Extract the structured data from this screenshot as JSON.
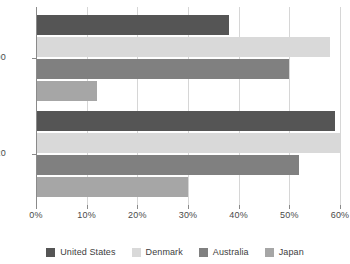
{
  "chart_data": {
    "type": "bar",
    "orientation": "horizontal",
    "title": "",
    "subtitle": "",
    "xlabel": "",
    "ylabel": "",
    "categories": [
      "1990",
      "2020"
    ],
    "series": [
      {
        "name": "United States",
        "color": "#555555",
        "values": [
          38,
          59
        ]
      },
      {
        "name": "Denmark",
        "color": "#d9d9d9",
        "values": [
          58,
          60
        ]
      },
      {
        "name": "Australia",
        "color": "#808080",
        "values": [
          50,
          52
        ]
      },
      {
        "name": "Japan",
        "color": "#a6a6a6",
        "values": [
          12,
          30
        ]
      }
    ],
    "xlim": [
      0,
      60
    ],
    "x_tick_values": [
      0,
      10,
      20,
      30,
      40,
      50,
      60
    ],
    "x_tick_labels": [
      "0%",
      "10%",
      "20%",
      "30%",
      "40%",
      "50%",
      "60%"
    ],
    "grid": true,
    "grid_axis": "x",
    "legend_position": "bottom",
    "value_suffix": "%"
  },
  "axes": {
    "y_group_labels": [
      "1990",
      "2020"
    ],
    "x_tick_labels": [
      "0%",
      "10%",
      "20%",
      "30%",
      "40%",
      "50%",
      "60%"
    ]
  },
  "legend": {
    "entries": [
      {
        "label": "United States",
        "color": "#555555"
      },
      {
        "label": "Denmark",
        "color": "#d9d9d9"
      },
      {
        "label": "Australia",
        "color": "#808080"
      },
      {
        "label": "Japan",
        "color": "#a6a6a6"
      }
    ]
  },
  "colors": {
    "background": "#ffffff",
    "gridline": "#d6d6d6",
    "axis": "#8a8a8a",
    "text": "#3d3d3d"
  }
}
